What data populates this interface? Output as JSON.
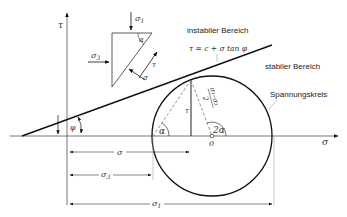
{
  "labels": {
    "tau_axis": "τ",
    "sigma_axis": "σ",
    "sigma1_top": "σ",
    "sigma1_top_sub": "1",
    "sigma3_left": "σ",
    "sigma3_left_sub": "3",
    "alpha_triangle": "α",
    "tau_triangle": "τ",
    "sigma_triangle": "σ",
    "instabil": "instabiler Bereich",
    "formula": "τ = c + σ tan φ",
    "stabil": "stabiler Bereich",
    "circle": "Spannungskreis",
    "radius_num": "σ₁–σ₃",
    "radius_den": "2",
    "tau_inner": "τ",
    "alpha_circle": "α",
    "two_alpha": "2α",
    "origin": "0",
    "phi": "φ",
    "dim_sigma": "σ",
    "dim_sigma3": "σ",
    "dim_sigma3_sub": "3",
    "dim_sigma1": "σ",
    "dim_sigma1_sub": "1"
  }
}
